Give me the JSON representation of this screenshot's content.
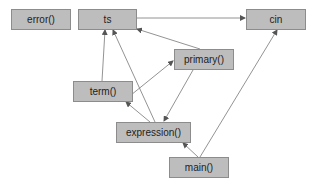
{
  "diagram": {
    "type": "call-graph",
    "colors": {
      "node_fill": "#bdbdbd",
      "node_border": "#8c8c8c",
      "edge": "#666666",
      "background": "#ffffff"
    },
    "nodes": [
      {
        "id": "error",
        "label": "error()"
      },
      {
        "id": "ts",
        "label": "ts"
      },
      {
        "id": "cin",
        "label": "cin"
      },
      {
        "id": "primary",
        "label": "primary()"
      },
      {
        "id": "term",
        "label": "term()"
      },
      {
        "id": "expression",
        "label": "expression()"
      },
      {
        "id": "main",
        "label": "main()"
      }
    ],
    "edges": [
      {
        "from": "ts",
        "to": "cin"
      },
      {
        "from": "term",
        "to": "ts"
      },
      {
        "from": "expression",
        "to": "ts"
      },
      {
        "from": "primary",
        "to": "ts"
      },
      {
        "from": "term",
        "to": "primary"
      },
      {
        "from": "primary",
        "to": "expression"
      },
      {
        "from": "expression",
        "to": "term"
      },
      {
        "from": "main",
        "to": "expression"
      },
      {
        "from": "main",
        "to": "cin"
      }
    ]
  }
}
